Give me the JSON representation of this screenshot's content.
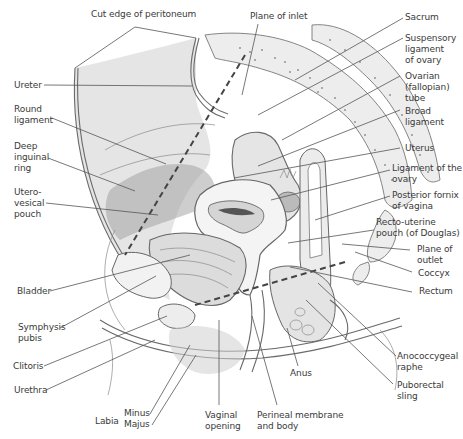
{
  "diagram": {
    "type": "anatomical-illustration",
    "labels": {
      "cut_edge_of_peritoneum": "Cut edge of peritoneum",
      "plane_of_inlet": "Plane of inlet",
      "sacrum": "Sacrum",
      "suspensory_ligament": "Suspensory\nligament\nof ovary",
      "ovarian_tube": "Ovarian\n(fallopian)\ntube",
      "broad_ligament": "Broad\nligament",
      "uterus": "Uterus",
      "ligament_of_ovary": "Ligament of the\novary",
      "posterior_fornix": "Posterior fornix\nof vagina",
      "recto_uterine_pouch": "Recto-uterine\npouch (of Douglas)",
      "plane_of_outlet": "Plane of\noutlet",
      "coccyx": "Coccyx",
      "rectum": "Rectum",
      "anococcygeal_raphe": "Anococcygeal\nraphe",
      "puborectal_sling": "Puborectal\nsling",
      "anus": "Anus",
      "perineal_membrane": "Perineal membrane\nand body",
      "vaginal_opening": "Vaginal\nopening",
      "labia": "Labia",
      "minus": "Minus",
      "majus": "Majus",
      "urethra": "Urethra",
      "clitoris": "Clitoris",
      "symphysis_pubis": "Symphysis\npubis",
      "bladder": "Bladder",
      "utero_vesical_pouch": "Utero-\nvesical\npouch",
      "deep_inguinal_ring": "Deep\ninguinal\nring",
      "round_ligament": "Round\nligament",
      "ureter": "Ureter"
    }
  }
}
